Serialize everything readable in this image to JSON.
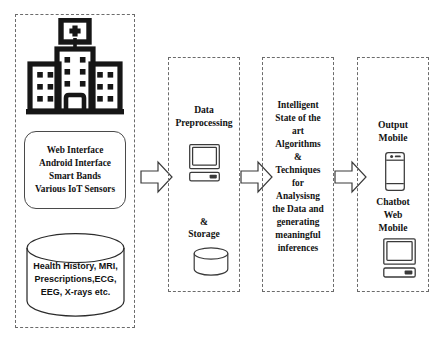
{
  "diagram": {
    "columns": [
      {
        "id": "data-sources",
        "icon": "hospital-icon",
        "interfaces_box": {
          "lines": [
            "Web Interface",
            "Android Interface",
            "Smart Bands",
            "Various IoT Sensors"
          ]
        },
        "database": {
          "icon": "database-cylinder-icon",
          "lines": [
            "Health History, MRI,",
            "Prescriptions,ECG,",
            "EEG, X-rays etc."
          ]
        }
      },
      {
        "id": "data-preprocessing",
        "title_lines": [
          "Data",
          "Preprocessing"
        ],
        "icon": "monitor-icon",
        "amp": "&",
        "storage_label": "Storage",
        "storage_icon": "database-cylinder-icon"
      },
      {
        "id": "intelligent-algorithms",
        "body_lines": [
          "Intelligent",
          "State of the",
          "art",
          "Algorithms",
          "&",
          "Techniques",
          "for",
          "Analysisng",
          "the Data and",
          "generating",
          "meaningful",
          "inferences"
        ]
      },
      {
        "id": "output",
        "top_lines": [
          "Output",
          "Mobile"
        ],
        "phone_icon": "mobile-phone-icon",
        "mid_lines": [
          "Chatbot",
          "Web",
          "Mobile"
        ],
        "monitor_icon": "monitor-icon"
      }
    ],
    "arrows": [
      {
        "id": "arrow-sources-to-preprocessing",
        "icon": "right-block-arrow-icon"
      },
      {
        "id": "arrow-preprocessing-to-algorithms",
        "icon": "right-block-arrow-icon"
      },
      {
        "id": "arrow-algorithms-to-output",
        "icon": "right-block-arrow-icon"
      }
    ],
    "colors": {
      "stroke": "#121212",
      "dashed_border": "#6b6b6b",
      "background": "#ffffff"
    }
  }
}
